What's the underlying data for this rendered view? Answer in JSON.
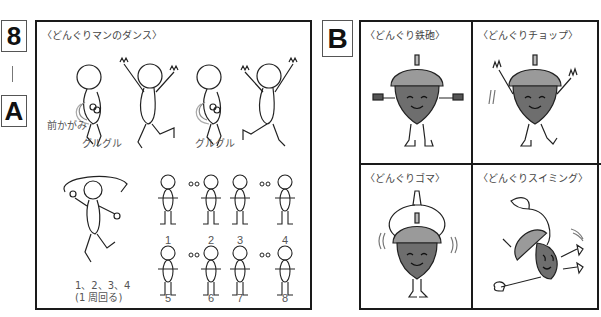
{
  "labels": {
    "section_number": "8",
    "separator": "|",
    "part_a": "A",
    "part_b": "B"
  },
  "panel_a": {
    "title": "〈どんぐりマンのダンス〉",
    "annotations": {
      "lean_forward": "前かがみ",
      "spin_1": "グルグル",
      "spin_2": "グルグル",
      "counts": "1、2、3、4",
      "one_lap": "(1 周回る)"
    },
    "step_numbers": [
      "1",
      "2",
      "3",
      "4",
      "5",
      "6",
      "7",
      "8"
    ]
  },
  "panel_b": {
    "cells": [
      {
        "title": "〈どんぐり鉄砲〉",
        "icon": "acorn-gun-icon"
      },
      {
        "title": "〈どんぐりチョップ〉",
        "icon": "acorn-chop-icon"
      },
      {
        "title": "〈どんぐりゴマ〉",
        "icon": "acorn-spin-icon"
      },
      {
        "title": "〈どんぐりスイミング〉",
        "icon": "acorn-swim-icon"
      }
    ]
  },
  "colors": {
    "border": "#1a1a1a",
    "acorn_cap": "#9a9a9a",
    "acorn_body": "#6e6e6e",
    "text": "#444444"
  }
}
